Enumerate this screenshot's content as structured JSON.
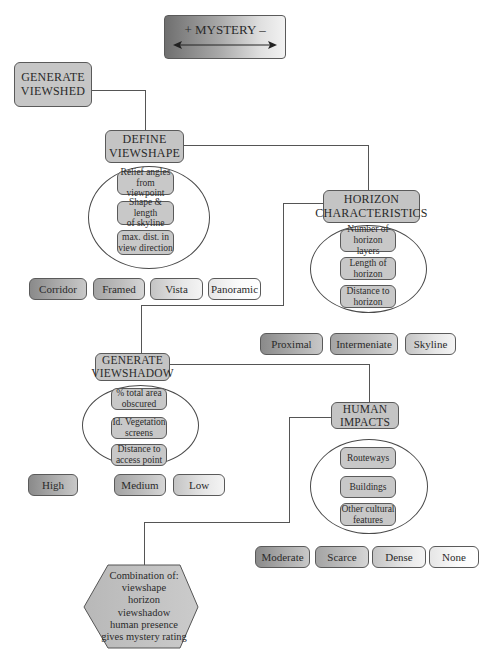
{
  "title": {
    "label": "+ MYSTERY –",
    "arrow": "double-headed-arrow"
  },
  "nodes": {
    "generate_viewshed": {
      "line1": "GENERATE",
      "line2": "VIEWSHED"
    },
    "define_viewshape": {
      "line1": "DEFINE",
      "line2": "VIEWSHAPE",
      "factors": [
        {
          "line1": "Relief angles",
          "line2": "from viewpoint"
        },
        {
          "line1": "Shape & length",
          "line2": "of skyline"
        },
        {
          "line1": "max. dist. in",
          "line2": "view direction"
        }
      ],
      "options": [
        "Corridor",
        "Framed",
        "Vista",
        "Panoramic"
      ]
    },
    "horizon_characteristics": {
      "line1": "HORIZON",
      "line2": "CHARACTERISTICS",
      "factors": [
        {
          "line1": "Number of",
          "line2": "horizon layers"
        },
        {
          "line1": "Length of",
          "line2": "horizon"
        },
        {
          "line1": "Distance to",
          "line2": "horizon"
        }
      ],
      "options": [
        "Proximal",
        "Intermeniate",
        "Skyline"
      ]
    },
    "generate_viewshadow": {
      "line1": "GENERATE",
      "line2": "VIEWSHADOW",
      "factors": [
        {
          "line1": "% total area",
          "line2": "obscured"
        },
        {
          "line1": "Id. Vegetation",
          "line2": "screens"
        },
        {
          "line1": "Distance to",
          "line2": "access point"
        }
      ],
      "options": [
        "High",
        "Medium",
        "Low"
      ]
    },
    "human_impacts": {
      "line1": "HUMAN",
      "line2": "IMPACTS",
      "factors": [
        {
          "line1": "Routeways",
          "line2": ""
        },
        {
          "line1": "Buildings",
          "line2": ""
        },
        {
          "line1": "Other cultural",
          "line2": "features"
        }
      ],
      "options": [
        "Moderate",
        "Scarce",
        "Dense",
        "None"
      ]
    },
    "result": {
      "lines": [
        "Combination of:",
        "viewshape",
        "horizon",
        "viewshadow",
        "human presence",
        "gives mystery rating"
      ]
    }
  },
  "colors": {
    "box_fill": "#c4c4c4",
    "border": "#5a5a5a",
    "line": "#555555"
  }
}
